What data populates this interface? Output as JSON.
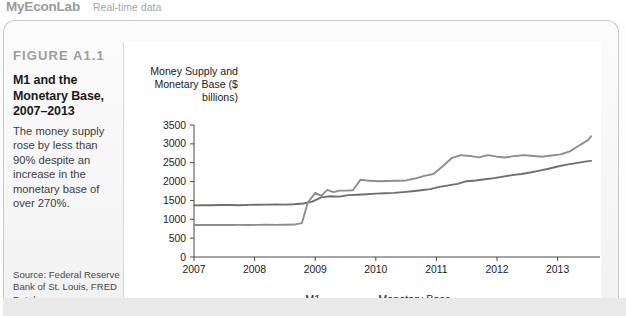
{
  "header": {
    "brand_main": "MyEconLab",
    "brand_sub": "Real-time data"
  },
  "figure": {
    "label": "FIGURE A1.1",
    "title": "M1 and the Monetary Base, 2007–2013",
    "description": "The money supply rose by less than 90% despite an increase in the monetary base of over 270%.",
    "source": "Source: Federal Reserve Bank of St. Louis, FRED Database. http://research.stlouisfed.org/fred2/"
  },
  "chart_data": {
    "type": "line",
    "title": "",
    "axis_title": "Money Supply and Monetary Base ($ billions)",
    "xlabel": "",
    "ylabel": "Money Supply and Monetary Base ($ billions)",
    "xlim": [
      2007,
      2013.6
    ],
    "ylim": [
      0,
      3500
    ],
    "ytick_step": 500,
    "yticks": [
      0,
      500,
      1000,
      1500,
      2000,
      2500,
      3000,
      3500
    ],
    "xticks": [
      2007,
      2008,
      2009,
      2010,
      2011,
      2012,
      2013
    ],
    "xtick_labels": [
      "2007",
      "2008",
      "2009",
      "2010",
      "2011",
      "2012",
      "2013"
    ],
    "grid": false,
    "legend_position": "bottom-center",
    "line_color_m1": "#6f6f6f",
    "line_color_base": "#8d8d8d",
    "series": [
      {
        "name": "M1",
        "color": "#6f6f6f",
        "x": [
          2007.0,
          2007.15,
          2007.3,
          2007.45,
          2007.6,
          2007.75,
          2007.9,
          2008.05,
          2008.2,
          2008.35,
          2008.5,
          2008.65,
          2008.8,
          2008.95,
          2009.1,
          2009.25,
          2009.4,
          2009.55,
          2009.7,
          2009.85,
          2010.0,
          2010.15,
          2010.3,
          2010.45,
          2010.6,
          2010.75,
          2010.9,
          2011.05,
          2011.2,
          2011.35,
          2011.5,
          2011.65,
          2011.8,
          2011.95,
          2012.1,
          2012.25,
          2012.4,
          2012.55,
          2012.7,
          2012.85,
          2013.0,
          2013.15,
          2013.3,
          2013.45,
          2013.55
        ],
        "values": [
          1370,
          1375,
          1372,
          1380,
          1378,
          1374,
          1382,
          1385,
          1390,
          1392,
          1388,
          1400,
          1420,
          1470,
          1580,
          1610,
          1600,
          1640,
          1650,
          1665,
          1680,
          1690,
          1700,
          1720,
          1745,
          1770,
          1800,
          1860,
          1900,
          1940,
          2010,
          2030,
          2060,
          2090,
          2130,
          2170,
          2200,
          2240,
          2290,
          2340,
          2400,
          2450,
          2490,
          2530,
          2550
        ]
      },
      {
        "name": "Monetary Base",
        "color": "#8d8d8d",
        "x": [
          2007.0,
          2007.15,
          2007.3,
          2007.45,
          2007.6,
          2007.75,
          2007.9,
          2008.05,
          2008.2,
          2008.35,
          2008.5,
          2008.65,
          2008.78,
          2008.88,
          2009.0,
          2009.1,
          2009.2,
          2009.3,
          2009.4,
          2009.5,
          2009.62,
          2009.75,
          2009.9,
          2010.05,
          2010.2,
          2010.35,
          2010.5,
          2010.65,
          2010.8,
          2010.95,
          2011.1,
          2011.25,
          2011.4,
          2011.55,
          2011.7,
          2011.85,
          2012.0,
          2012.15,
          2012.3,
          2012.45,
          2012.6,
          2012.75,
          2012.9,
          2013.05,
          2013.2,
          2013.35,
          2013.5,
          2013.55
        ],
        "values": [
          850,
          848,
          852,
          850,
          849,
          851,
          850,
          852,
          855,
          853,
          856,
          860,
          900,
          1450,
          1700,
          1620,
          1780,
          1720,
          1760,
          1760,
          1770,
          2050,
          2020,
          2010,
          2015,
          2020,
          2030,
          2080,
          2150,
          2200,
          2400,
          2620,
          2700,
          2680,
          2640,
          2700,
          2660,
          2640,
          2680,
          2700,
          2680,
          2660,
          2690,
          2720,
          2800,
          2950,
          3100,
          3200
        ]
      }
    ],
    "legend": [
      {
        "name": "M1",
        "color": "#6f6f6f"
      },
      {
        "name": "Monetary Base",
        "color": "#8d8d8d"
      }
    ]
  }
}
